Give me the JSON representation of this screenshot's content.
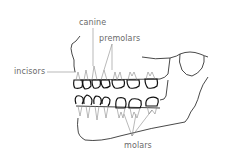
{
  "diagram": {
    "labels": {
      "canine": "canine",
      "premolars": "premolars",
      "incisors": "incisors",
      "molars": "molars"
    },
    "colors": {
      "outline": "#1a1a1a",
      "label_text": "#6a6a6a",
      "leader_line": "#8a8a8a",
      "background": "#ffffff"
    }
  }
}
